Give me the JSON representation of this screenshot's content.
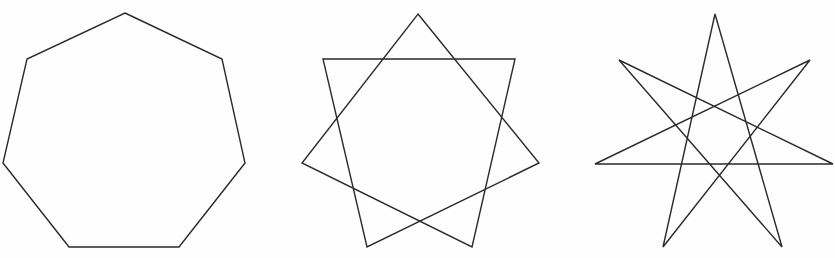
{
  "figure": {
    "stroke_color": "#2a2a2a",
    "background_color": "#fefefe",
    "shapes": [
      {
        "name": "heptagon",
        "schlafli": "{7}",
        "points": "125,13 222,59 245,163 179,247 69,247 3,163 27,59"
      },
      {
        "name": "heptagram-7-2",
        "schlafli": "{7/2}",
        "points": "418,14 539,163 367,247 323,59 515,59 472,247 302,163"
      },
      {
        "name": "heptagram-7-3",
        "schlafli": "{7/3}",
        "points": "715,14 782,247 619,60 833,164 595,164 810,60 663,247"
      }
    ]
  }
}
